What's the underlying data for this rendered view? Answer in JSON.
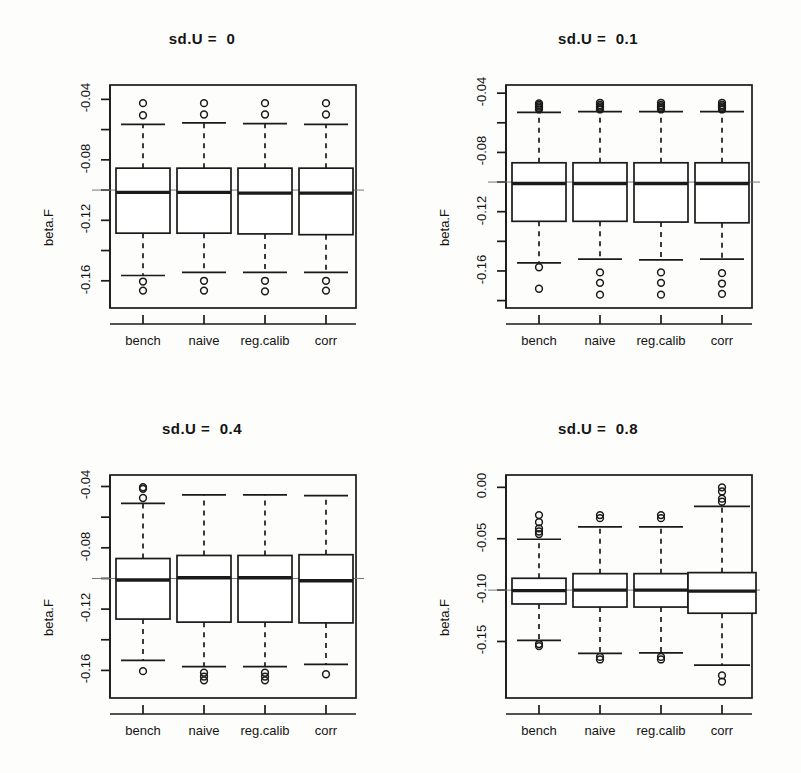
{
  "figure": {
    "ylabel": "beta.F",
    "categories": [
      "bench",
      "naive",
      "reg.calib",
      "corr"
    ],
    "reference_line_value": -0.1,
    "line_color": "#1a1a1a",
    "background_color": "#fdfdfc"
  },
  "panels": [
    {
      "title": "sd.U =  0",
      "ylim": [
        -0.178,
        -0.0305
      ],
      "yticks_labeled": [
        "-0.04",
        "-0.08",
        "-0.12",
        "-0.16"
      ],
      "ytick_values": [
        -0.04,
        -0.08,
        -0.12,
        -0.16
      ],
      "yticks_minor": [
        -0.06,
        -0.1,
        -0.14,
        -0.18
      ]
    },
    {
      "title": "sd.U =  0.1",
      "ylim": [
        -0.185,
        -0.0345
      ],
      "yticks_labeled": [
        "-0.04",
        "-0.08",
        "-0.12",
        "-0.16"
      ],
      "ytick_values": [
        -0.04,
        -0.08,
        -0.12,
        -0.16
      ],
      "yticks_minor": [
        -0.06,
        -0.1,
        -0.14,
        -0.18
      ]
    },
    {
      "title": "sd.U =  0.4",
      "ylim": [
        -0.178,
        -0.0325
      ],
      "yticks_labeled": [
        "-0.04",
        "-0.08",
        "-0.12",
        "-0.16"
      ],
      "ytick_values": [
        -0.04,
        -0.08,
        -0.12,
        -0.16
      ],
      "yticks_minor": [
        -0.06,
        -0.1,
        -0.14,
        -0.18
      ]
    },
    {
      "title": "sd.U =  0.8",
      "ylim": [
        -0.205,
        0.012
      ],
      "yticks_labeled": [
        "0.00",
        "-0.05",
        "-0.10",
        "-0.15"
      ],
      "ytick_values": [
        0.0,
        -0.05,
        -0.1,
        -0.15
      ],
      "yticks_minor": []
    }
  ],
  "chart_data": {
    "type": "box",
    "xlabel": "",
    "ylabel": "beta.F",
    "categories": [
      "bench",
      "naive",
      "reg.calib",
      "corr"
    ],
    "grid": false,
    "legend": "none",
    "reference_line": -0.1,
    "panels": [
      {
        "title": "sd.U =  0",
        "ylim": [
          -0.178,
          -0.0305
        ],
        "yticks": [
          -0.04,
          -0.08,
          -0.12,
          -0.16
        ],
        "boxes": [
          {
            "category": "bench",
            "whisker_low": -0.1565,
            "q1": -0.1285,
            "median": -0.1015,
            "q3": -0.0855,
            "whisker_high": -0.0565,
            "outliers": [
              -0.0425,
              -0.0505,
              -0.1605,
              -0.1665
            ]
          },
          {
            "category": "naive",
            "whisker_low": -0.1545,
            "q1": -0.1285,
            "median": -0.1015,
            "q3": -0.0855,
            "whisker_high": -0.0555,
            "outliers": [
              -0.0425,
              -0.05,
              -0.16,
              -0.1665
            ]
          },
          {
            "category": "reg.calib",
            "whisker_low": -0.1545,
            "q1": -0.129,
            "median": -0.102,
            "q3": -0.0855,
            "whisker_high": -0.056,
            "outliers": [
              -0.0425,
              -0.05,
              -0.16,
              -0.167
            ]
          },
          {
            "category": "corr",
            "whisker_low": -0.1545,
            "q1": -0.1295,
            "median": -0.102,
            "q3": -0.0855,
            "whisker_high": -0.0565,
            "outliers": [
              -0.0425,
              -0.05,
              -0.16,
              -0.1665
            ]
          }
        ]
      },
      {
        "title": "sd.U =  0.1",
        "ylim": [
          -0.185,
          -0.0345
        ],
        "yticks": [
          -0.04,
          -0.08,
          -0.12,
          -0.16
        ],
        "boxes": [
          {
            "category": "bench",
            "whisker_low": -0.1545,
            "q1": -0.1265,
            "median": -0.101,
            "q3": -0.087,
            "whisker_high": -0.053,
            "outliers": [
              -0.047,
              -0.048,
              -0.049,
              -0.05,
              -0.051,
              -0.1575,
              -0.172
            ]
          },
          {
            "category": "naive",
            "whisker_low": -0.152,
            "q1": -0.1265,
            "median": -0.101,
            "q3": -0.087,
            "whisker_high": -0.0525,
            "outliers": [
              -0.0465,
              -0.048,
              -0.049,
              -0.05,
              -0.051,
              -0.161,
              -0.168,
              -0.176
            ]
          },
          {
            "category": "reg.calib",
            "whisker_low": -0.1525,
            "q1": -0.127,
            "median": -0.101,
            "q3": -0.087,
            "whisker_high": -0.0525,
            "outliers": [
              -0.0465,
              -0.048,
              -0.049,
              -0.05,
              -0.051,
              -0.161,
              -0.168,
              -0.176
            ]
          },
          {
            "category": "corr",
            "whisker_low": -0.152,
            "q1": -0.1275,
            "median": -0.101,
            "q3": -0.087,
            "whisker_high": -0.0525,
            "outliers": [
              -0.0465,
              -0.048,
              -0.049,
              -0.05,
              -0.051,
              -0.1615,
              -0.1685,
              -0.1755
            ]
          }
        ]
      },
      {
        "title": "sd.U =  0.4",
        "ylim": [
          -0.178,
          -0.0325
        ],
        "yticks": [
          -0.04,
          -0.08,
          -0.12,
          -0.16
        ],
        "boxes": [
          {
            "category": "bench",
            "whisker_low": -0.1535,
            "q1": -0.1265,
            "median": -0.101,
            "q3": -0.087,
            "whisker_high": -0.051,
            "outliers": [
              -0.0405,
              -0.0415,
              -0.0475,
              -0.1605
            ]
          },
          {
            "category": "naive",
            "whisker_low": -0.1575,
            "q1": -0.1285,
            "median": -0.0995,
            "q3": -0.085,
            "whisker_high": -0.0455,
            "outliers": [
              -0.1615,
              -0.164,
              -0.1665
            ]
          },
          {
            "category": "reg.calib",
            "whisker_low": -0.1575,
            "q1": -0.1285,
            "median": -0.0995,
            "q3": -0.085,
            "whisker_high": -0.0455,
            "outliers": [
              -0.1615,
              -0.164,
              -0.1665
            ]
          },
          {
            "category": "corr",
            "whisker_low": -0.156,
            "q1": -0.129,
            "median": -0.1015,
            "q3": -0.0845,
            "whisker_high": -0.046,
            "outliers": [
              -0.1625
            ]
          }
        ]
      },
      {
        "title": "sd.U =  0.8",
        "ylim": [
          -0.205,
          0.012
        ],
        "yticks": [
          0.0,
          -0.05,
          -0.1,
          -0.15
        ],
        "boxes": [
          {
            "category": "bench",
            "whisker_low": -0.149,
            "q1": -0.1135,
            "median": -0.1005,
            "q3": -0.0885,
            "whisker_high": -0.0505,
            "outliers": [
              -0.027,
              -0.034,
              -0.04,
              -0.043,
              -0.0455,
              -0.1525,
              -0.1545
            ]
          },
          {
            "category": "naive",
            "whisker_low": -0.1615,
            "q1": -0.1165,
            "median": -0.1,
            "q3": -0.084,
            "whisker_high": -0.0385,
            "outliers": [
              -0.027,
              -0.03,
              -0.165,
              -0.1675
            ]
          },
          {
            "category": "reg.calib",
            "whisker_low": -0.161,
            "q1": -0.1165,
            "median": -0.1,
            "q3": -0.084,
            "whisker_high": -0.0385,
            "outliers": [
              -0.027,
              -0.03,
              -0.165,
              -0.1675
            ]
          },
          {
            "category": "corr",
            "whisker_low": -0.173,
            "q1": -0.1225,
            "median": -0.101,
            "q3": -0.083,
            "whisker_high": -0.0185,
            "outliers": [
              0.0,
              -0.004,
              -0.011,
              -0.014,
              -0.183,
              -0.189
            ]
          }
        ]
      }
    ]
  }
}
